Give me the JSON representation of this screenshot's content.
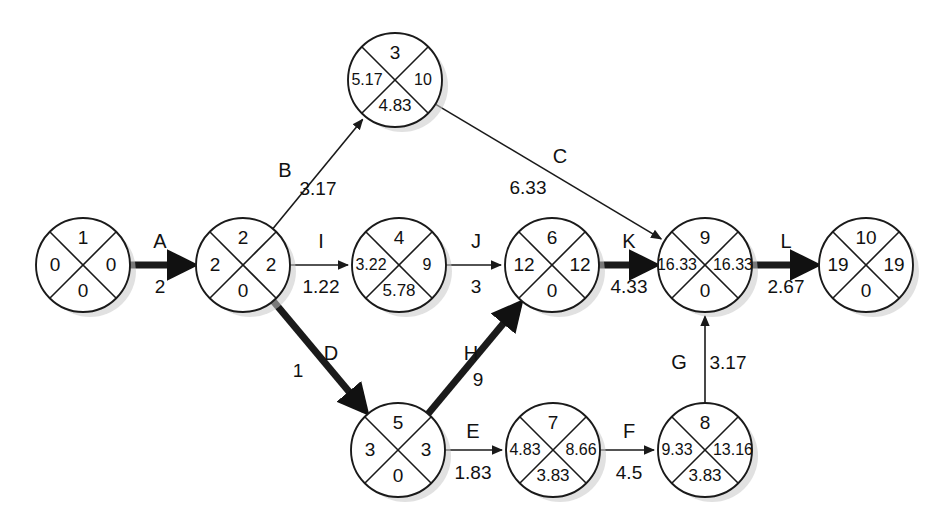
{
  "diagram": {
    "type": "pert-cpm-network",
    "node_radius": 47,
    "node_shadow_color": "#c9c9c9",
    "stroke_color": "#1a1a1a",
    "background": "#ffffff",
    "critical_path_activities": [
      "A",
      "D",
      "H",
      "K",
      "L"
    ],
    "quadrant_legend": {
      "top": "event-number",
      "left": "earliest-time",
      "right": "latest-time",
      "bottom": "slack"
    },
    "nodes": [
      {
        "id": "n1",
        "number": "1",
        "left": "0",
        "right": "0",
        "bottom": "0",
        "cx": 83,
        "cy": 265
      },
      {
        "id": "n2",
        "number": "2",
        "left": "2",
        "right": "2",
        "bottom": "0",
        "cx": 243,
        "cy": 265
      },
      {
        "id": "n3",
        "number": "3",
        "left": "5.17",
        "right": "10",
        "bottom": "4.83",
        "cx": 395,
        "cy": 80
      },
      {
        "id": "n4",
        "number": "4",
        "left": "3.22",
        "right": "9",
        "bottom": "5.78",
        "cx": 399,
        "cy": 265
      },
      {
        "id": "n5",
        "number": "5",
        "left": "3",
        "right": "3",
        "bottom": "0",
        "cx": 398,
        "cy": 450
      },
      {
        "id": "n6",
        "number": "6",
        "left": "12",
        "right": "12",
        "bottom": "0",
        "cx": 552,
        "cy": 265
      },
      {
        "id": "n7",
        "number": "7",
        "left": "4.83",
        "right": "8.66",
        "bottom": "3.83",
        "cx": 553,
        "cy": 450
      },
      {
        "id": "n8",
        "number": "8",
        "left": "9.33",
        "right": "13.16",
        "bottom": "3.83",
        "cx": 705,
        "cy": 450
      },
      {
        "id": "n9",
        "number": "9",
        "left": "16.33",
        "right": "16.33",
        "bottom": "0",
        "cx": 705,
        "cy": 265
      },
      {
        "id": "n10",
        "number": "10",
        "left": "19",
        "right": "19",
        "bottom": "0",
        "cx": 866,
        "cy": 265
      }
    ],
    "edges": [
      {
        "id": "A",
        "label": "A",
        "duration": "2",
        "from": "n1",
        "to": "n2",
        "critical": true,
        "label_x": 160,
        "label_y": 243,
        "dur_x": 160,
        "dur_y": 288
      },
      {
        "id": "B",
        "label": "B",
        "duration": "3.17",
        "from": "n2",
        "to": "n3",
        "critical": false,
        "label_x": 285,
        "label_y": 172,
        "dur_x": 318,
        "dur_y": 190
      },
      {
        "id": "C",
        "label": "C",
        "duration": "6.33",
        "from": "n3",
        "to": "n9",
        "critical": false,
        "label_x": 560,
        "label_y": 158,
        "dur_x": 528,
        "dur_y": 189
      },
      {
        "id": "D",
        "label": "D",
        "duration": "1",
        "from": "n2",
        "to": "n5",
        "critical": true,
        "label_x": 331,
        "label_y": 355,
        "dur_x": 298,
        "dur_y": 372
      },
      {
        "id": "E",
        "label": "E",
        "duration": "1.83",
        "from": "n5",
        "to": "n7",
        "critical": false,
        "label_x": 473,
        "label_y": 433,
        "dur_x": 473,
        "dur_y": 474
      },
      {
        "id": "F",
        "label": "F",
        "duration": "4.5",
        "from": "n7",
        "to": "n8",
        "critical": false,
        "label_x": 629,
        "label_y": 433,
        "dur_x": 629,
        "dur_y": 474
      },
      {
        "id": "G",
        "label": "G",
        "duration": "3.17",
        "from": "n8",
        "to": "n9",
        "critical": false,
        "label_x": 679,
        "label_y": 364,
        "dur_x": 728,
        "dur_y": 364
      },
      {
        "id": "H",
        "label": "H",
        "duration": "9",
        "from": "n5",
        "to": "n6",
        "critical": true,
        "label_x": 471,
        "label_y": 355,
        "dur_x": 478,
        "dur_y": 381
      },
      {
        "id": "I",
        "label": "I",
        "duration": "1.22",
        "from": "n2",
        "to": "n4",
        "critical": false,
        "label_x": 321,
        "label_y": 243,
        "dur_x": 321,
        "dur_y": 288
      },
      {
        "id": "J",
        "label": "J",
        "duration": "3",
        "from": "n4",
        "to": "n6",
        "critical": false,
        "label_x": 476,
        "label_y": 243,
        "dur_x": 476,
        "dur_y": 288
      },
      {
        "id": "K",
        "label": "K",
        "duration": "4.33",
        "from": "n6",
        "to": "n9",
        "critical": true,
        "label_x": 629,
        "label_y": 243,
        "dur_x": 629,
        "dur_y": 288
      },
      {
        "id": "L",
        "label": "L",
        "duration": "2.67",
        "from": "n9",
        "to": "n10",
        "critical": true,
        "label_x": 786,
        "label_y": 243,
        "dur_x": 786,
        "dur_y": 288
      }
    ]
  }
}
